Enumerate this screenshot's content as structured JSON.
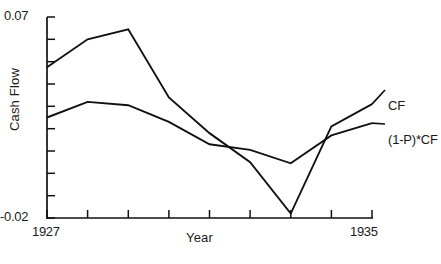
{
  "chart_data": {
    "type": "line",
    "title": "",
    "xlabel": "Year",
    "ylabel": "Cash Flow",
    "xlim": [
      1927,
      1935
    ],
    "ylim": [
      -0.02,
      0.07
    ],
    "ytick_labels": [
      "0.07",
      "-0.02"
    ],
    "xtick_labels": [
      "1927",
      "1935"
    ],
    "ytick_values": [
      -0.02,
      -0.01,
      0.0,
      0.01,
      0.02,
      0.03,
      0.04,
      0.05,
      0.06,
      0.07
    ],
    "xtick_values": [
      1927,
      1928,
      1929,
      1930,
      1931,
      1932,
      1933,
      1934,
      1935
    ],
    "grid": false,
    "legend_position": "right-inline",
    "x": [
      1927,
      1928,
      1929,
      1930,
      1931,
      1932,
      1933,
      1934,
      1935
    ],
    "series": [
      {
        "name": "CF",
        "label": "CF",
        "values": [
          0.0475,
          0.06,
          0.0645,
          0.034,
          0.018,
          0.005,
          -0.018,
          0.021,
          0.031
        ],
        "color": "#111111"
      },
      {
        "name": "(1-P)*CF",
        "label": "(1-P)*CF",
        "values": [
          0.025,
          0.032,
          0.0305,
          0.023,
          0.013,
          0.0105,
          0.0045,
          0.017,
          0.0225
        ],
        "color": "#111111"
      }
    ]
  },
  "axes": {
    "y_top_label": "0.07",
    "y_bottom_label": "-0.02",
    "x_left_label": "1927",
    "x_right_label": "1935",
    "x_title": "Year",
    "y_title": "Cash Flow"
  },
  "legend": {
    "cf_label": "CF",
    "pcf_label": "(1-P)*CF"
  }
}
